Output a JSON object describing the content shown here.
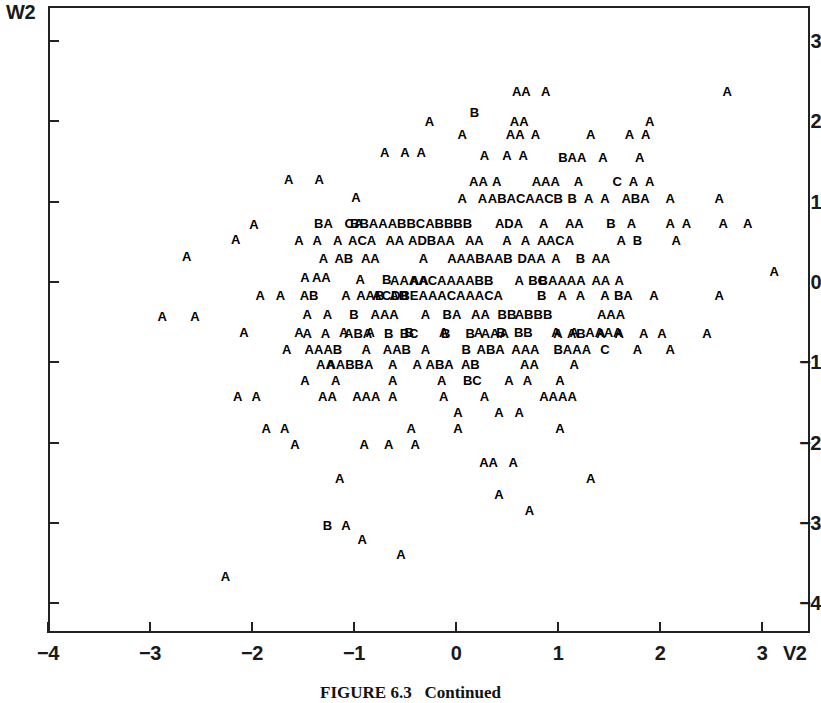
{
  "figure": {
    "caption": "FIGURE 6.3   Continued",
    "y_axis_name": "W2",
    "x_axis_name": "V2"
  },
  "chart_data": {
    "type": "scatter",
    "title": "FIGURE 6.3   Continued",
    "xlabel": "V2",
    "ylabel": "W2",
    "xlim": [
      -4.0,
      3.28
    ],
    "ylim": [
      -4.55,
      3.37
    ],
    "xticks": [
      -4,
      -3,
      -2,
      -1,
      0,
      1,
      2,
      3
    ],
    "xtick_labels": [
      "−4",
      "−3",
      "−2",
      "−1",
      "0",
      "1",
      "2",
      "3"
    ],
    "yticks": [
      3,
      2,
      1,
      0,
      -1,
      -2,
      -3,
      -4
    ],
    "ytick_labels": [
      "3",
      "2",
      "1",
      "0",
      "−1",
      "−2",
      "−3",
      "−4"
    ],
    "grid": false,
    "legend": null,
    "marker_encoding": "Letter glyphs encode overplotting count: A=1 observation, B=2, C=3, D=4, E=5 coincident points.",
    "marker_levels": [
      "A",
      "B",
      "C",
      "D",
      "E"
    ],
    "points": [
      {
        "x": 0.64,
        "y": 2.38,
        "label": "AA"
      },
      {
        "x": 0.88,
        "y": 2.38,
        "label": "A"
      },
      {
        "x": 2.66,
        "y": 2.38,
        "label": "A"
      },
      {
        "x": 0.18,
        "y": 2.12,
        "label": "B"
      },
      {
        "x": -0.26,
        "y": 2.0,
        "label": "A"
      },
      {
        "x": 0.62,
        "y": 2.0,
        "label": "AA"
      },
      {
        "x": 1.9,
        "y": 2.0,
        "label": "A"
      },
      {
        "x": 0.06,
        "y": 1.84,
        "label": "A"
      },
      {
        "x": 0.58,
        "y": 1.84,
        "label": "AA"
      },
      {
        "x": 0.78,
        "y": 1.84,
        "label": "A"
      },
      {
        "x": 1.32,
        "y": 1.84,
        "label": "A"
      },
      {
        "x": 1.7,
        "y": 1.84,
        "label": "A"
      },
      {
        "x": 1.86,
        "y": 1.84,
        "label": "A"
      },
      {
        "x": -0.7,
        "y": 1.62,
        "label": "A"
      },
      {
        "x": -0.5,
        "y": 1.62,
        "label": "A"
      },
      {
        "x": -0.34,
        "y": 1.62,
        "label": "A"
      },
      {
        "x": 0.28,
        "y": 1.58,
        "label": "A"
      },
      {
        "x": 0.5,
        "y": 1.58,
        "label": "A"
      },
      {
        "x": 0.66,
        "y": 1.58,
        "label": "A"
      },
      {
        "x": 1.14,
        "y": 1.56,
        "label": "BAA"
      },
      {
        "x": 1.44,
        "y": 1.56,
        "label": "A"
      },
      {
        "x": 1.8,
        "y": 1.56,
        "label": "A"
      },
      {
        "x": -1.64,
        "y": 1.28,
        "label": "A"
      },
      {
        "x": -1.34,
        "y": 1.28,
        "label": "A"
      },
      {
        "x": 0.22,
        "y": 1.26,
        "label": "AA"
      },
      {
        "x": 0.4,
        "y": 1.26,
        "label": "A"
      },
      {
        "x": 0.88,
        "y": 1.26,
        "label": "AAA"
      },
      {
        "x": 1.2,
        "y": 1.26,
        "label": "A"
      },
      {
        "x": 1.58,
        "y": 1.26,
        "label": "C"
      },
      {
        "x": 1.74,
        "y": 1.26,
        "label": "A"
      },
      {
        "x": 1.9,
        "y": 1.26,
        "label": "A"
      },
      {
        "x": -0.98,
        "y": 1.06,
        "label": "A"
      },
      {
        "x": 0.06,
        "y": 1.04,
        "label": "A"
      },
      {
        "x": 0.26,
        "y": 1.04,
        "label": "A"
      },
      {
        "x": 0.68,
        "y": 1.04,
        "label": "ABACAACB"
      },
      {
        "x": 1.14,
        "y": 1.04,
        "label": "B"
      },
      {
        "x": 1.3,
        "y": 1.04,
        "label": "A"
      },
      {
        "x": 1.46,
        "y": 1.04,
        "label": "A"
      },
      {
        "x": 1.76,
        "y": 1.04,
        "label": "ABA"
      },
      {
        "x": 2.1,
        "y": 1.04,
        "label": "A"
      },
      {
        "x": 2.58,
        "y": 1.04,
        "label": "A"
      },
      {
        "x": -1.98,
        "y": 0.72,
        "label": "A"
      },
      {
        "x": -1.3,
        "y": 0.74,
        "label": "BA"
      },
      {
        "x": -1.0,
        "y": 0.74,
        "label": "CA"
      },
      {
        "x": -0.44,
        "y": 0.74,
        "label": "BBAAABBCABBBB"
      },
      {
        "x": 0.52,
        "y": 0.74,
        "label": "ADA"
      },
      {
        "x": 0.86,
        "y": 0.74,
        "label": "A"
      },
      {
        "x": 1.16,
        "y": 0.74,
        "label": "AA"
      },
      {
        "x": 1.52,
        "y": 0.74,
        "label": "B"
      },
      {
        "x": 1.72,
        "y": 0.74,
        "label": "A"
      },
      {
        "x": 2.1,
        "y": 0.74,
        "label": "A"
      },
      {
        "x": 2.26,
        "y": 0.74,
        "label": "A"
      },
      {
        "x": 2.62,
        "y": 0.74,
        "label": "A"
      },
      {
        "x": 2.86,
        "y": 0.74,
        "label": "A"
      },
      {
        "x": -2.16,
        "y": 0.54,
        "label": "A"
      },
      {
        "x": -1.54,
        "y": 0.52,
        "label": "A"
      },
      {
        "x": -1.36,
        "y": 0.52,
        "label": "A"
      },
      {
        "x": -1.16,
        "y": 0.52,
        "label": "A"
      },
      {
        "x": -0.92,
        "y": 0.52,
        "label": "ACA"
      },
      {
        "x": -0.6,
        "y": 0.52,
        "label": "AA"
      },
      {
        "x": -0.24,
        "y": 0.52,
        "label": "ADBAA"
      },
      {
        "x": 0.18,
        "y": 0.52,
        "label": "AA"
      },
      {
        "x": 0.5,
        "y": 0.52,
        "label": "A"
      },
      {
        "x": 0.68,
        "y": 0.52,
        "label": "A"
      },
      {
        "x": 0.84,
        "y": 0.52,
        "label": "A"
      },
      {
        "x": 1.02,
        "y": 0.52,
        "label": "ACA"
      },
      {
        "x": 1.62,
        "y": 0.52,
        "label": "A"
      },
      {
        "x": 1.78,
        "y": 0.52,
        "label": "B"
      },
      {
        "x": 2.16,
        "y": 0.52,
        "label": "A"
      },
      {
        "x": -2.64,
        "y": 0.32,
        "label": "A"
      },
      {
        "x": -1.3,
        "y": 0.3,
        "label": "A"
      },
      {
        "x": -1.1,
        "y": 0.3,
        "label": "AB"
      },
      {
        "x": -0.84,
        "y": 0.3,
        "label": "AA"
      },
      {
        "x": -0.32,
        "y": 0.3,
        "label": "A"
      },
      {
        "x": -0.04,
        "y": 0.3,
        "label": "A"
      },
      {
        "x": 0.28,
        "y": 0.3,
        "label": "AABAAB"
      },
      {
        "x": 0.74,
        "y": 0.3,
        "label": "DAA"
      },
      {
        "x": 0.98,
        "y": 0.3,
        "label": "A"
      },
      {
        "x": 1.22,
        "y": 0.3,
        "label": "B"
      },
      {
        "x": 1.42,
        "y": 0.3,
        "label": "AA"
      },
      {
        "x": -1.48,
        "y": 0.06,
        "label": "A"
      },
      {
        "x": -1.32,
        "y": 0.06,
        "label": "AA"
      },
      {
        "x": -0.94,
        "y": 0.04,
        "label": "A"
      },
      {
        "x": -0.68,
        "y": 0.04,
        "label": "B"
      },
      {
        "x": -0.36,
        "y": 0.02,
        "label": "AA"
      },
      {
        "x": -0.14,
        "y": 0.02,
        "label": "AAAACAAAABB"
      },
      {
        "x": 0.62,
        "y": 0.02,
        "label": "A"
      },
      {
        "x": 0.8,
        "y": 0.02,
        "label": "BC"
      },
      {
        "x": 1.04,
        "y": 0.02,
        "label": "BAAAA"
      },
      {
        "x": 1.42,
        "y": 0.02,
        "label": "AA"
      },
      {
        "x": 1.6,
        "y": 0.02,
        "label": "A"
      },
      {
        "x": 3.12,
        "y": 0.14,
        "label": "A"
      },
      {
        "x": -1.92,
        "y": -0.16,
        "label": "A"
      },
      {
        "x": -1.72,
        "y": -0.16,
        "label": "A"
      },
      {
        "x": -1.44,
        "y": -0.16,
        "label": "AB"
      },
      {
        "x": -1.08,
        "y": -0.16,
        "label": "A"
      },
      {
        "x": -0.84,
        "y": -0.16,
        "label": "AAB"
      },
      {
        "x": -0.56,
        "y": -0.16,
        "label": "AB"
      },
      {
        "x": -0.18,
        "y": -0.16,
        "label": "ACDBEAAACAAACA"
      },
      {
        "x": 0.84,
        "y": -0.16,
        "label": "B"
      },
      {
        "x": 1.04,
        "y": -0.16,
        "label": "A"
      },
      {
        "x": 1.22,
        "y": -0.16,
        "label": "A"
      },
      {
        "x": 1.46,
        "y": -0.16,
        "label": "A"
      },
      {
        "x": 1.64,
        "y": -0.16,
        "label": "BA"
      },
      {
        "x": 1.94,
        "y": -0.16,
        "label": "A"
      },
      {
        "x": 2.58,
        "y": -0.16,
        "label": "A"
      },
      {
        "x": -1.46,
        "y": -0.4,
        "label": "A"
      },
      {
        "x": -1.26,
        "y": -0.4,
        "label": "A"
      },
      {
        "x": -1.0,
        "y": -0.4,
        "label": "B"
      },
      {
        "x": -0.7,
        "y": -0.4,
        "label": "AAA"
      },
      {
        "x": -0.3,
        "y": -0.4,
        "label": "A"
      },
      {
        "x": -0.04,
        "y": -0.4,
        "label": "BA"
      },
      {
        "x": 0.24,
        "y": -0.4,
        "label": "AA"
      },
      {
        "x": 0.5,
        "y": -0.4,
        "label": "BB"
      },
      {
        "x": 0.76,
        "y": -0.4,
        "label": "ABBB"
      },
      {
        "x": 1.52,
        "y": -0.4,
        "label": "AAA"
      },
      {
        "x": -2.88,
        "y": -0.42,
        "label": "A"
      },
      {
        "x": -2.56,
        "y": -0.42,
        "label": "A"
      },
      {
        "x": -1.54,
        "y": -0.62,
        "label": "A"
      },
      {
        "x": -1.1,
        "y": -0.62,
        "label": "A"
      },
      {
        "x": -0.84,
        "y": -0.62,
        "label": "A"
      },
      {
        "x": -0.46,
        "y": -0.62,
        "label": "B"
      },
      {
        "x": -0.12,
        "y": -0.62,
        "label": "A"
      },
      {
        "x": 0.22,
        "y": -0.62,
        "label": "A"
      },
      {
        "x": 0.44,
        "y": -0.62,
        "label": "B"
      },
      {
        "x": 0.66,
        "y": -0.62,
        "label": "BB"
      },
      {
        "x": 0.98,
        "y": -0.62,
        "label": "A"
      },
      {
        "x": 1.16,
        "y": -0.62,
        "label": "A"
      },
      {
        "x": 1.36,
        "y": -0.62,
        "label": "AA"
      },
      {
        "x": 1.54,
        "y": -0.62,
        "label": "AA"
      },
      {
        "x": -2.08,
        "y": -0.62,
        "label": "A"
      },
      {
        "x": -1.46,
        "y": -0.64,
        "label": "A"
      },
      {
        "x": -1.28,
        "y": -0.64,
        "label": "A"
      },
      {
        "x": -0.96,
        "y": -0.64,
        "label": "ABA"
      },
      {
        "x": -0.66,
        "y": -0.64,
        "label": "B"
      },
      {
        "x": -0.46,
        "y": -0.64,
        "label": "BC"
      },
      {
        "x": -0.1,
        "y": -0.64,
        "label": "B"
      },
      {
        "x": 0.14,
        "y": -0.64,
        "label": "B"
      },
      {
        "x": 0.38,
        "y": -0.64,
        "label": "AAA"
      },
      {
        "x": 1.0,
        "y": -0.64,
        "label": "A"
      },
      {
        "x": 1.18,
        "y": -0.64,
        "label": "AB"
      },
      {
        "x": 1.42,
        "y": -0.64,
        "label": "A"
      },
      {
        "x": 1.6,
        "y": -0.64,
        "label": "A"
      },
      {
        "x": 1.84,
        "y": -0.64,
        "label": "A"
      },
      {
        "x": 2.02,
        "y": -0.64,
        "label": "A"
      },
      {
        "x": 2.46,
        "y": -0.64,
        "label": "A"
      },
      {
        "x": -1.66,
        "y": -0.84,
        "label": "A"
      },
      {
        "x": -1.3,
        "y": -0.84,
        "label": "AAAB"
      },
      {
        "x": -0.88,
        "y": -0.84,
        "label": "A"
      },
      {
        "x": -0.58,
        "y": -0.84,
        "label": "AAB"
      },
      {
        "x": -0.3,
        "y": -0.84,
        "label": "A"
      },
      {
        "x": 0.1,
        "y": -0.84,
        "label": "B"
      },
      {
        "x": 0.34,
        "y": -0.84,
        "label": "ABA"
      },
      {
        "x": 0.68,
        "y": -0.84,
        "label": "AAA"
      },
      {
        "x": 1.14,
        "y": -0.84,
        "label": "BAAA"
      },
      {
        "x": 1.46,
        "y": -0.84,
        "label": "C"
      },
      {
        "x": 1.78,
        "y": -0.84,
        "label": "A"
      },
      {
        "x": 2.1,
        "y": -0.84,
        "label": "A"
      },
      {
        "x": -1.28,
        "y": -1.02,
        "label": "AA"
      },
      {
        "x": -1.04,
        "y": -1.02,
        "label": "AABBA"
      },
      {
        "x": -0.62,
        "y": -1.02,
        "label": "A"
      },
      {
        "x": -0.38,
        "y": -1.02,
        "label": "A"
      },
      {
        "x": -0.16,
        "y": -1.02,
        "label": "ABA"
      },
      {
        "x": 0.14,
        "y": -1.02,
        "label": "AB"
      },
      {
        "x": 0.72,
        "y": -1.02,
        "label": "AA"
      },
      {
        "x": 1.16,
        "y": -1.02,
        "label": "A"
      },
      {
        "x": -1.48,
        "y": -1.22,
        "label": "A"
      },
      {
        "x": -1.18,
        "y": -1.22,
        "label": "A"
      },
      {
        "x": -0.62,
        "y": -1.22,
        "label": "A"
      },
      {
        "x": -0.14,
        "y": -1.22,
        "label": "A"
      },
      {
        "x": 0.16,
        "y": -1.22,
        "label": "BC"
      },
      {
        "x": 0.52,
        "y": -1.22,
        "label": "A"
      },
      {
        "x": 0.7,
        "y": -1.22,
        "label": "A"
      },
      {
        "x": 1.02,
        "y": -1.22,
        "label": "A"
      },
      {
        "x": -2.14,
        "y": -1.42,
        "label": "A"
      },
      {
        "x": -1.96,
        "y": -1.42,
        "label": "A"
      },
      {
        "x": -1.26,
        "y": -1.42,
        "label": "AA"
      },
      {
        "x": -0.88,
        "y": -1.42,
        "label": "AAA"
      },
      {
        "x": -0.62,
        "y": -1.42,
        "label": "A"
      },
      {
        "x": -0.12,
        "y": -1.42,
        "label": "A"
      },
      {
        "x": 0.28,
        "y": -1.42,
        "label": "A"
      },
      {
        "x": 1.0,
        "y": -1.42,
        "label": "AAAA"
      },
      {
        "x": 0.02,
        "y": -1.62,
        "label": "A"
      },
      {
        "x": 0.42,
        "y": -1.62,
        "label": "A"
      },
      {
        "x": 0.62,
        "y": -1.62,
        "label": "A"
      },
      {
        "x": -1.86,
        "y": -1.82,
        "label": "A"
      },
      {
        "x": -1.68,
        "y": -1.82,
        "label": "A"
      },
      {
        "x": -0.44,
        "y": -1.82,
        "label": "A"
      },
      {
        "x": 0.02,
        "y": -1.82,
        "label": "A"
      },
      {
        "x": 1.02,
        "y": -1.82,
        "label": "A"
      },
      {
        "x": -1.58,
        "y": -2.02,
        "label": "A"
      },
      {
        "x": -0.9,
        "y": -2.02,
        "label": "A"
      },
      {
        "x": -0.66,
        "y": -2.02,
        "label": "A"
      },
      {
        "x": -0.4,
        "y": -2.02,
        "label": "A"
      },
      {
        "x": 0.32,
        "y": -2.24,
        "label": "AA"
      },
      {
        "x": 0.56,
        "y": -2.24,
        "label": "A"
      },
      {
        "x": -1.14,
        "y": -2.44,
        "label": "A"
      },
      {
        "x": 1.32,
        "y": -2.44,
        "label": "A"
      },
      {
        "x": 0.42,
        "y": -2.64,
        "label": "A"
      },
      {
        "x": 0.72,
        "y": -2.84,
        "label": "A"
      },
      {
        "x": -1.26,
        "y": -3.02,
        "label": "B"
      },
      {
        "x": -1.08,
        "y": -3.02,
        "label": "A"
      },
      {
        "x": -0.92,
        "y": -3.2,
        "label": "A"
      },
      {
        "x": -0.54,
        "y": -3.38,
        "label": "A"
      },
      {
        "x": -2.26,
        "y": -3.66,
        "label": "A"
      }
    ]
  }
}
